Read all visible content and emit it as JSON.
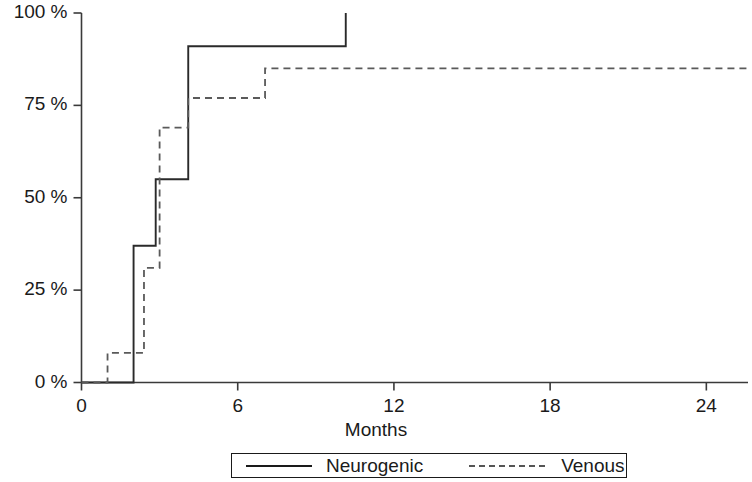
{
  "chart_data": {
    "type": "line",
    "subtype": "kaplan-meier-step",
    "title": "",
    "xlabel": "Months",
    "ylabel": "",
    "xlim": [
      0,
      25.6
    ],
    "ylim": [
      0,
      100
    ],
    "grid": false,
    "x_ticks": [
      0,
      6,
      12,
      18,
      24
    ],
    "x_tick_labels": [
      "0",
      "6",
      "12",
      "18",
      "24"
    ],
    "y_ticks": [
      0,
      25,
      50,
      75,
      100
    ],
    "y_tick_labels": [
      "0 %",
      "25 %",
      "50 %",
      "75 %",
      "100 %"
    ],
    "legend_position": "bottom-center",
    "series": [
      {
        "name": "Neurogenic",
        "style": "solid",
        "color": "#1a1a1a",
        "x": [
          0,
          2.0,
          2.0,
          2.85,
          2.85,
          4.1,
          4.1,
          10.15,
          10.15
        ],
        "y": [
          0,
          0,
          37,
          37,
          55,
          55,
          91,
          91,
          100
        ],
        "steps": [
          {
            "month": 0.0,
            "percent": 0
          },
          {
            "month": 2.0,
            "percent": 37
          },
          {
            "month": 2.85,
            "percent": 55
          },
          {
            "month": 4.1,
            "percent": 91
          },
          {
            "month": 10.15,
            "percent": 100
          }
        ]
      },
      {
        "name": "Venous",
        "style": "dashed",
        "color": "#555555",
        "x": [
          0,
          1.0,
          1.0,
          2.4,
          2.4,
          3.0,
          3.0,
          4.1,
          4.1,
          7.05,
          7.05,
          25.6
        ],
        "y": [
          0,
          0,
          8,
          8,
          31,
          31,
          69,
          69,
          77,
          77,
          85,
          85
        ],
        "steps": [
          {
            "month": 0.0,
            "percent": 0
          },
          {
            "month": 1.0,
            "percent": 8
          },
          {
            "month": 2.4,
            "percent": 31
          },
          {
            "month": 3.0,
            "percent": 69
          },
          {
            "month": 4.1,
            "percent": 77
          },
          {
            "month": 7.05,
            "percent": 85
          }
        ]
      }
    ]
  },
  "legend": {
    "entries": [
      {
        "label": "Neurogenic",
        "style": "solid"
      },
      {
        "label": "Venous",
        "style": "dashed"
      }
    ]
  },
  "axis": {
    "x_title": "Months"
  }
}
